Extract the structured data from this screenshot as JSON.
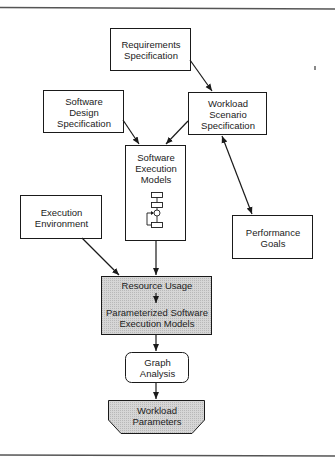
{
  "diagram": {
    "nodes": [
      {
        "id": "requirements",
        "lines": [
          "Requirements",
          "Specification"
        ],
        "style": "box"
      },
      {
        "id": "software_design",
        "lines": [
          "Software",
          "Design",
          "Specification"
        ],
        "style": "box"
      },
      {
        "id": "workload_scenario",
        "lines": [
          "Workload",
          "Scenario",
          "Specification"
        ],
        "style": "box"
      },
      {
        "id": "software_execution_models",
        "lines": [
          "Software",
          "Execution",
          "Models"
        ],
        "style": "box",
        "icon": "flowchart-icon"
      },
      {
        "id": "execution_environment",
        "lines": [
          "Execution",
          "Environment"
        ],
        "style": "box"
      },
      {
        "id": "performance_goals",
        "lines": [
          "Performance",
          "Goals"
        ],
        "style": "box"
      },
      {
        "id": "resource_usage",
        "lines": [
          "Resource Usage"
        ],
        "style": "shaded"
      },
      {
        "id": "parameterized_models",
        "lines": [
          "Parameterized Software",
          "Execution Models"
        ],
        "style": "shaded"
      },
      {
        "id": "graph_analysis",
        "lines": [
          "Graph",
          "Analysis"
        ],
        "style": "rounded"
      },
      {
        "id": "workload_parameters",
        "lines": [
          "Workload",
          "Parameters"
        ],
        "style": "shaded-trapezoid"
      }
    ],
    "edges": [
      {
        "from": "requirements",
        "to": "workload_scenario"
      },
      {
        "from": "software_design",
        "to": "software_execution_models"
      },
      {
        "from": "workload_scenario",
        "to": "software_execution_models"
      },
      {
        "from": "workload_scenario",
        "to": "performance_goals",
        "bidirectional": true
      },
      {
        "from": "software_execution_models",
        "to": "resource_usage"
      },
      {
        "from": "execution_environment",
        "to": "resource_usage"
      },
      {
        "from": "resource_usage",
        "to": "parameterized_models"
      },
      {
        "from": "parameterized_models",
        "to": "graph_analysis"
      },
      {
        "from": "graph_analysis",
        "to": "workload_parameters"
      }
    ],
    "colors": {
      "line": "#1a1a1a",
      "shade": "#cfcfcf",
      "rule": "#555555"
    }
  }
}
